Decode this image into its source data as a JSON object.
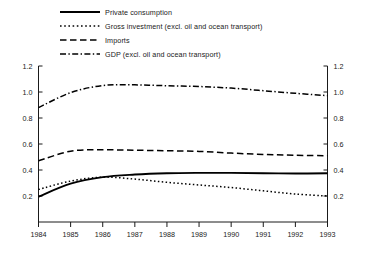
{
  "chart_data": {
    "type": "line",
    "title": "",
    "subtitle": "",
    "xlabel": "",
    "ylabel": "",
    "xlim": [
      1984,
      1993
    ],
    "ylim": [
      0,
      1.2
    ],
    "grid": false,
    "legend_position": "top-left",
    "dual_y_axis": true,
    "x": [
      1984,
      1985,
      1986,
      1987,
      1988,
      1989,
      1990,
      1991,
      1992,
      1993
    ],
    "xticklabels": [
      "1984",
      "1985",
      "1986",
      "1987",
      "1988",
      "1989",
      "1990",
      "1991",
      "1992",
      "1993"
    ],
    "yticks": [
      0.2,
      0.4,
      0.6,
      0.8,
      1.0,
      1.2
    ],
    "yticklabels": [
      "0.2",
      "0.4",
      "0.6",
      "0.8",
      "1.0",
      "1.2"
    ],
    "yticklabels_right": [
      "0.2",
      "0.4",
      "0.6",
      "0.8",
      "1.0",
      "1.2"
    ],
    "series": [
      {
        "name": "Private consumption",
        "style": "solid",
        "color": "#000000",
        "values": [
          0.195,
          0.295,
          0.345,
          0.365,
          0.375,
          0.378,
          0.378,
          0.375,
          0.373,
          0.375
        ]
      },
      {
        "name": "Gross investment (excl. oil and ocean transport)",
        "style": "dotted",
        "color": "#000000",
        "values": [
          0.25,
          0.315,
          0.345,
          0.33,
          0.305,
          0.285,
          0.265,
          0.24,
          0.215,
          0.2
        ]
      },
      {
        "name": "Imports",
        "style": "dashed",
        "color": "#000000",
        "values": [
          0.47,
          0.545,
          0.555,
          0.552,
          0.548,
          0.543,
          0.53,
          0.52,
          0.513,
          0.51
        ]
      },
      {
        "name": "GDP (excl. oil and ocean transport)",
        "style": "dash-dot",
        "color": "#000000",
        "values": [
          0.88,
          0.995,
          1.05,
          1.055,
          1.048,
          1.042,
          1.03,
          1.01,
          0.99,
          0.972
        ]
      }
    ]
  },
  "legend": {
    "items": [
      {
        "label": "Private consumption",
        "style": "solid"
      },
      {
        "label": "Gross investment (excl. oil and ocean transport)",
        "style": "dotted"
      },
      {
        "label": "Imports",
        "style": "dashed"
      },
      {
        "label": "GDP (excl. oil and ocean transport)",
        "style": "dash-dot"
      }
    ]
  }
}
